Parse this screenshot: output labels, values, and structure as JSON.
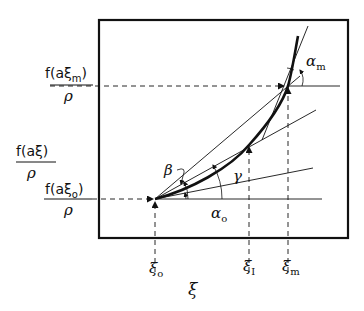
{
  "diagram": {
    "y_labels": {
      "top": {
        "numerator": "f(aξ",
        "sub": "m",
        "close": ")",
        "denominator": "ρ"
      },
      "middle": {
        "numerator": "f(aξ)",
        "denominator": "ρ"
      },
      "bottom": {
        "numerator": "f(aξ",
        "sub": "o",
        "close": ")",
        "denominator": "ρ"
      }
    },
    "x_labels": {
      "xi0": {
        "base": "ξ",
        "sub": "o"
      },
      "xi1": {
        "base": "ξ",
        "sub": "I"
      },
      "xim": {
        "base": "ξ",
        "sub": "m"
      },
      "axis": "ξ"
    },
    "angle_labels": {
      "alpha_m": {
        "base": "α",
        "sub": "m"
      },
      "alpha_o": {
        "base": "α",
        "sub": "o"
      },
      "beta": "β",
      "gamma": "γ"
    },
    "colors": {
      "ink": "#111111",
      "background": "#ffffff"
    }
  }
}
